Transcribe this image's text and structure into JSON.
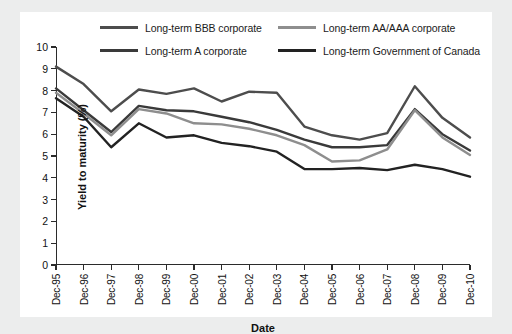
{
  "chart_data": {
    "type": "line",
    "title": "",
    "xlabel": "Date",
    "ylabel": "Yield to maturity (%)",
    "ylim": [
      0,
      10
    ],
    "ytick_step": 1,
    "yticks": [
      "0",
      "1",
      "2",
      "3",
      "4",
      "5",
      "6",
      "7",
      "8",
      "9",
      "10"
    ],
    "grid": false,
    "legend_position": "top",
    "categories": [
      "Dec-95",
      "Dec-96",
      "Dec-97",
      "Dec-98",
      "Dec-99",
      "Dec-00",
      "Dec-01",
      "Dec-02",
      "Dec-03",
      "Dec-04",
      "Dec-05",
      "Dec-06",
      "Dec-07",
      "Dec-08",
      "Dec-09",
      "Dec-10"
    ],
    "series": [
      {
        "name": "Long-term BBB corporate",
        "color": "#4d4d4d",
        "values": [
          9.1,
          8.3,
          7.05,
          8.05,
          7.85,
          8.1,
          7.5,
          7.95,
          7.9,
          6.35,
          5.95,
          5.75,
          6.05,
          8.2,
          6.75,
          5.85
        ]
      },
      {
        "name": "Long-term A corporate",
        "color": "#3a3a3a",
        "values": [
          8.1,
          7.1,
          6.1,
          7.3,
          7.1,
          7.05,
          6.8,
          6.55,
          6.2,
          5.75,
          5.4,
          5.4,
          5.5,
          7.15,
          6.0,
          5.25
        ]
      },
      {
        "name": "Long-term AA/AAA corporate",
        "color": "#8e8e8e",
        "values": [
          7.9,
          6.95,
          5.95,
          7.15,
          6.95,
          6.5,
          6.45,
          6.25,
          5.95,
          5.5,
          4.75,
          4.8,
          5.3,
          7.1,
          5.85,
          5.05
        ]
      },
      {
        "name": "Long-term Government of Canada",
        "color": "#222222",
        "values": [
          7.65,
          6.8,
          5.4,
          6.5,
          5.85,
          5.95,
          5.6,
          5.45,
          5.2,
          4.4,
          4.4,
          4.45,
          4.35,
          4.6,
          4.4,
          4.05
        ]
      }
    ]
  },
  "legend": {
    "items": [
      {
        "label": "Long-term BBB corporate"
      },
      {
        "label": "Long-term AA/AAA corporate"
      },
      {
        "label": "Long-term A corporate"
      },
      {
        "label": "Long-term Government of Canada"
      }
    ]
  }
}
